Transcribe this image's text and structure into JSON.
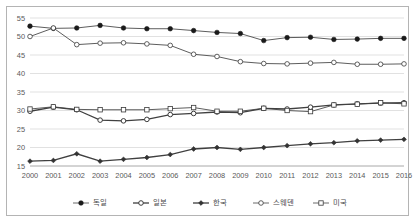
{
  "chart_data": {
    "type": "line",
    "title": "",
    "xlabel": "",
    "ylabel": "",
    "categories": [
      "2000",
      "2001",
      "2002",
      "2003",
      "2004",
      "2005",
      "2006",
      "2007",
      "2008",
      "2009",
      "2010",
      "2011",
      "2012",
      "2013",
      "2014",
      "2015",
      "2016"
    ],
    "x_tick_labels": [
      "2000",
      "2001",
      "2002",
      "2003",
      "2004",
      "2005",
      "2006",
      "2007",
      "2008",
      "2009",
      "2010",
      "2011",
      "2012",
      "2013",
      "2014",
      "2015",
      "2016"
    ],
    "y_tick_labels": [
      "15",
      "20",
      "25",
      "30",
      "35",
      "40",
      "45",
      "50",
      "55"
    ],
    "y_ticks": [
      15,
      20,
      25,
      30,
      35,
      40,
      45,
      50,
      55
    ],
    "ylim": [
      15,
      55
    ],
    "grid": true,
    "legend_position": "bottom",
    "series": [
      {
        "name": "독일",
        "marker": "filled-circle",
        "values": [
          52.8,
          52.2,
          52.3,
          53.0,
          52.3,
          52.1,
          52.1,
          51.6,
          51.1,
          50.8,
          48.9,
          49.7,
          49.8,
          49.2,
          49.3,
          49.5,
          49.5
        ]
      },
      {
        "name": "일본",
        "marker": "open-circle-thick",
        "values": [
          29.8,
          30.9,
          30.2,
          27.4,
          27.2,
          27.6,
          28.9,
          29.2,
          29.6,
          29.4,
          30.6,
          30.4,
          30.9,
          31.5,
          31.8,
          32.0,
          32.1
        ]
      },
      {
        "name": "한국",
        "marker": "filled-diamond",
        "values": [
          16.3,
          16.5,
          18.3,
          16.3,
          16.8,
          17.3,
          18.1,
          19.6,
          20.0,
          19.5,
          20.0,
          20.5,
          21.0,
          21.3,
          21.8,
          22.0,
          22.2
        ]
      },
      {
        "name": "스웨덴",
        "marker": "open-circle",
        "values": [
          50.0,
          52.3,
          47.8,
          48.2,
          48.3,
          48.0,
          47.6,
          45.2,
          44.6,
          43.2,
          42.7,
          42.6,
          42.8,
          43.0,
          42.5,
          42.5,
          42.6
        ]
      },
      {
        "name": "미국",
        "marker": "open-square",
        "values": [
          30.4,
          31.0,
          30.3,
          30.2,
          30.2,
          30.2,
          30.5,
          30.8,
          29.8,
          29.8,
          30.6,
          30.0,
          29.7,
          31.5,
          31.7,
          32.1,
          31.8
        ]
      }
    ]
  }
}
